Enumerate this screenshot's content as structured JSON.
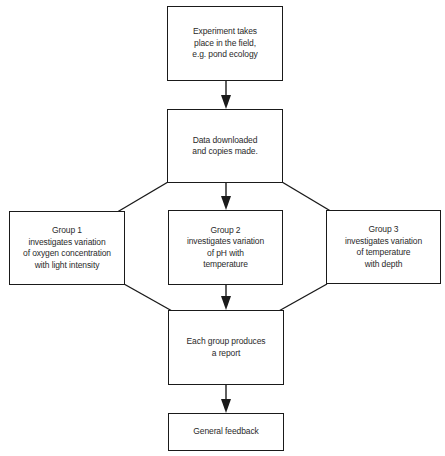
{
  "diagram": {
    "type": "flowchart",
    "nodes": {
      "experiment": {
        "lines": [
          "Experiment takes",
          "place in the field,",
          "e.g. pond ecology"
        ]
      },
      "data": {
        "lines": [
          "Data downloaded",
          "and copies made."
        ]
      },
      "group1": {
        "lines": [
          "Group 1",
          "investigates variation",
          "of oxygen concentration",
          "with light intensity"
        ]
      },
      "group2": {
        "lines": [
          "Group 2",
          "investigates variation",
          "of pH with",
          "temperature"
        ]
      },
      "group3": {
        "lines": [
          "Group 3",
          "investigates variation",
          "of temperature",
          "with depth"
        ]
      },
      "report": {
        "lines": [
          "Each group produces",
          "a report"
        ]
      },
      "feedback": {
        "lines": [
          "General feedback"
        ]
      }
    },
    "edges": [
      {
        "from": "experiment",
        "to": "data"
      },
      {
        "from": "data",
        "to": "group1"
      },
      {
        "from": "data",
        "to": "group2"
      },
      {
        "from": "data",
        "to": "group3"
      },
      {
        "from": "group1",
        "to": "report"
      },
      {
        "from": "group2",
        "to": "report"
      },
      {
        "from": "group3",
        "to": "report"
      },
      {
        "from": "report",
        "to": "feedback"
      }
    ],
    "colors": {
      "line": "#1a1a1a",
      "text": "#2a2a2a",
      "background": "#ffffff"
    }
  }
}
